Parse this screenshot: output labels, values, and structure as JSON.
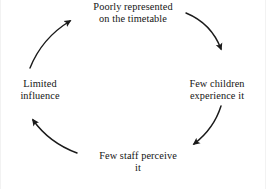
{
  "diagram": {
    "type": "cycle",
    "title": "",
    "direction": "clockwise",
    "nodes": [
      {
        "id": "top",
        "label_line1": "Poorly represented",
        "label_line2": "on the timetable",
        "position": "top"
      },
      {
        "id": "right",
        "label_line1": "Few children",
        "label_line2": "experience it",
        "position": "right"
      },
      {
        "id": "bottom",
        "label_line1": "Few staff perceive",
        "label_line2": "it",
        "position": "bottom"
      },
      {
        "id": "left",
        "label_line1": "Limited",
        "label_line2": "influence",
        "position": "left"
      }
    ],
    "edges": [
      {
        "from": "top",
        "to": "right",
        "arrow": "arrowhead-down-right"
      },
      {
        "from": "right",
        "to": "bottom",
        "arrow": "arrowhead-down-left"
      },
      {
        "from": "bottom",
        "to": "left",
        "arrow": "arrowhead-up-left"
      },
      {
        "from": "left",
        "to": "top",
        "arrow": "arrowhead-up-right"
      }
    ],
    "colors": {
      "stroke": "#1a1a1a",
      "text": "#141414",
      "background": "#ffffff"
    }
  }
}
